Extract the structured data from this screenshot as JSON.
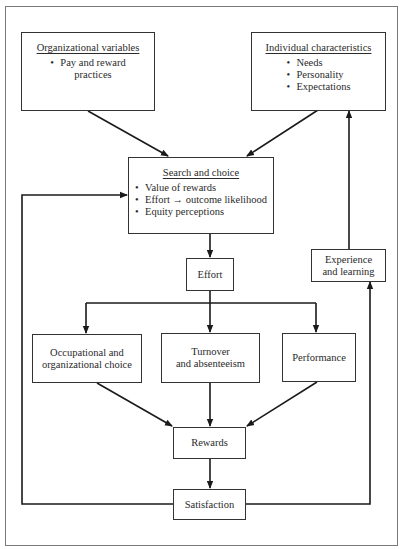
{
  "diagram": {
    "nodes": {
      "organizational_variables": {
        "title": "Organizational variables",
        "items": [
          "Pay and reward practices"
        ],
        "item_lines": [
          "Pay and reward",
          "practices"
        ]
      },
      "individual_characteristics": {
        "title": "Individual characteristics",
        "items": [
          "Needs",
          "Personality",
          "Expectations"
        ]
      },
      "search_and_choice": {
        "title": "Search and choice",
        "items": [
          "Value of rewards",
          "Effort → outcome likelihood",
          "Equity perceptions"
        ],
        "effort_item": {
          "left": "Effort",
          "arrow": "→",
          "right": "outcome likelihood"
        }
      },
      "effort": {
        "label": "Effort"
      },
      "experience_and_learning": {
        "line1": "Experience",
        "line2": "and learning"
      },
      "occupational_choice": {
        "line1": "Occupational and",
        "line2": "organizational choice"
      },
      "turnover": {
        "line1": "Turnover",
        "line2": "and absenteeism"
      },
      "performance": {
        "label": "Performance"
      },
      "rewards": {
        "label": "Rewards"
      },
      "satisfaction": {
        "label": "Satisfaction"
      }
    },
    "edges": [
      [
        "Organizational variables",
        "Search and choice"
      ],
      [
        "Individual characteristics",
        "Search and choice"
      ],
      [
        "Search and choice",
        "Effort"
      ],
      [
        "Effort",
        "Occupational and organizational choice"
      ],
      [
        "Effort",
        "Turnover and absenteeism"
      ],
      [
        "Effort",
        "Performance"
      ],
      [
        "Occupational and organizational choice",
        "Rewards"
      ],
      [
        "Turnover and absenteeism",
        "Rewards"
      ],
      [
        "Performance",
        "Rewards"
      ],
      [
        "Rewards",
        "Satisfaction"
      ],
      [
        "Satisfaction",
        "Search and choice"
      ],
      [
        "Satisfaction",
        "Experience and learning"
      ],
      [
        "Experience and learning",
        "Individual characteristics"
      ]
    ],
    "colors": {
      "line": "#1a1a1a",
      "box_border": "#333333",
      "frame": "#7a7a7a"
    }
  }
}
